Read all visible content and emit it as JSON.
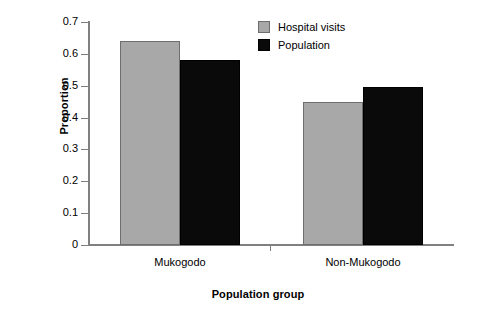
{
  "chart_data": {
    "type": "bar",
    "title": "",
    "subtitle": "",
    "xlabel": "Population group",
    "ylabel": "Proportion",
    "categories": [
      "Mukogodo",
      "Non-Mukogodo"
    ],
    "series": [
      {
        "name": "Hospital visits",
        "color": "#a8a8a8",
        "values": [
          0.64,
          0.45
        ]
      },
      {
        "name": "Population",
        "color": "#000000",
        "values": [
          0.58,
          0.495
        ]
      }
    ],
    "ylim": [
      0,
      0.7
    ],
    "ytick_values": [
      0,
      0.1,
      0.2,
      0.3,
      0.4,
      0.5,
      0.6,
      0.7
    ],
    "ytick_labels": [
      "0",
      "0.1",
      "0.2",
      "0.3",
      "0.4",
      "0.5",
      "0.6",
      "0.7"
    ],
    "grid": false,
    "legend_position": "top-right",
    "annotations": []
  },
  "axes": {
    "y_title": "Proportion",
    "x_title": "Population group"
  },
  "legend": {
    "items": [
      {
        "label": "Hospital visits",
        "swatch": "gray"
      },
      {
        "label": "Population",
        "swatch": "black"
      }
    ]
  },
  "colors": {
    "series_gray": "#a8a8a8",
    "series_black": "#000000",
    "axis": "#808080",
    "background": "#ffffff",
    "text": "#000000"
  }
}
